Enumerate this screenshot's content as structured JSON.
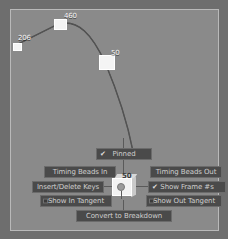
{
  "app": {
    "panel_name": "graph-editor",
    "background_color": "#8a8a8a",
    "border_color": "#b9b9b9",
    "curve_color": "#4a4a4a",
    "menu_background": "#4a4a4a",
    "menu_border": "#6b6b6b",
    "menu_text_color": "#cfcfcf",
    "keyframe_color": "#f4f4f4"
  },
  "curve": {
    "keyframes": [
      {
        "label": "206",
        "x": 8,
        "y": 40,
        "size": "small"
      },
      {
        "label": "460",
        "x": 52,
        "y": 17,
        "size": "med"
      },
      {
        "label": "50",
        "x": 99,
        "y": 52,
        "size": "big"
      }
    ],
    "path": "M 13 44 L 59 22 C 78 17 92 32 105 60 C 118 90 128 122 133 148"
  },
  "marking_menu": {
    "name": "keyframe-marking-menu",
    "center": {
      "label": "50",
      "icon": "keyframe-cube-icon"
    },
    "items": [
      {
        "id": "pinned",
        "label": "Pinned",
        "checked": true,
        "has_box": false
      },
      {
        "id": "beads-in",
        "label": "Timing Beads In",
        "checked": false,
        "has_box": false
      },
      {
        "id": "beads-out",
        "label": "Timing Beads Out",
        "checked": false,
        "has_box": false
      },
      {
        "id": "insert-keys",
        "label": "Insert/Delete Keys",
        "checked": false,
        "has_box": false
      },
      {
        "id": "show-frames",
        "label": "Show Frame #s",
        "checked": true,
        "has_box": false
      },
      {
        "id": "in-tangent",
        "label": "Show In Tangent",
        "checked": false,
        "has_box": true
      },
      {
        "id": "out-tangent",
        "label": "Show Out Tangent",
        "checked": false,
        "has_box": true
      },
      {
        "id": "convert",
        "label": "Convert to Breakdown",
        "checked": false,
        "has_box": false
      }
    ],
    "checkmark_glyph": "✔"
  }
}
